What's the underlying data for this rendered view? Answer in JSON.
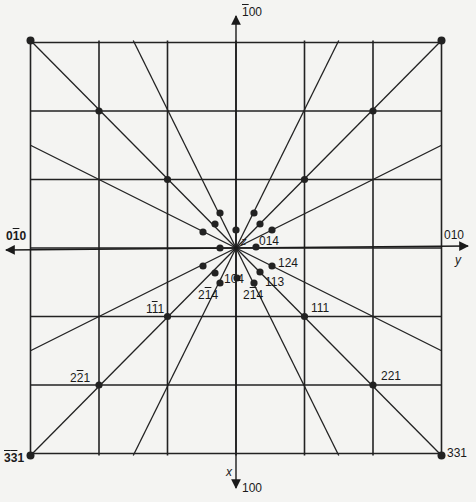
{
  "figure": {
    "type": "gnomonic projection",
    "ink_color": "#1a1a1a",
    "background": "#f4f4f2"
  },
  "axes": {
    "top": {
      "label": "100",
      "bar": "1",
      "arrow": "up"
    },
    "bottom": {
      "label": "100",
      "axis_name": "x",
      "arrow": "down"
    },
    "left": {
      "label": "010",
      "bar": "1",
      "arrow": "left"
    },
    "right": {
      "label": "010",
      "axis_name": "y",
      "arrow": "right"
    },
    "center": {
      "axis_name": "z"
    }
  },
  "labels": {
    "corner_bl": {
      "a": "3",
      "b": "3",
      "c": "1",
      "bars": "a,b"
    },
    "corner_br": {
      "text": "331"
    },
    "l_2m21": {
      "a": "2",
      "b": "2",
      "c": "1"
    },
    "l_1m11": {
      "a": "1",
      "b": "1",
      "c": "1"
    },
    "l_111": {
      "text": "111"
    },
    "l_221": {
      "text": "221"
    },
    "l_014": {
      "text": "014"
    },
    "l_124": {
      "text": "124"
    },
    "l_113": {
      "text": "113"
    },
    "l_104": {
      "text": "104"
    },
    "l_2m14": {
      "a": "2",
      "b": "1",
      "c": "4"
    },
    "l_214": {
      "a": "2",
      "b": "1",
      "c": "4"
    }
  },
  "grid": {
    "center": [
      236,
      248
    ],
    "step": 68.5,
    "half_extent": 3
  }
}
